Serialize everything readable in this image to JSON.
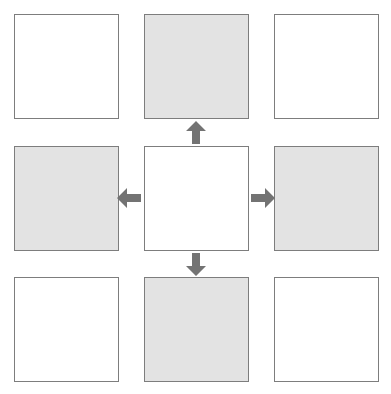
{
  "diagram": {
    "canvas": {
      "width": 391,
      "height": 394,
      "background": "#ffffff"
    },
    "style": {
      "cell_border_color": "#7d7d7d",
      "cell_border_width": 1.6,
      "white_fill": "#ffffff",
      "gray_fill": "#e3e3e3",
      "arrow_fill": "#737373"
    },
    "grid": {
      "rows": 3,
      "columns": 3,
      "cells": [
        {
          "id": "cell-top-left",
          "row": 0,
          "col": 0,
          "fill": "white",
          "x": 14,
          "y": 14,
          "width": 105,
          "height": 105,
          "label": ""
        },
        {
          "id": "cell-top-center",
          "row": 0,
          "col": 1,
          "fill": "gray",
          "x": 144,
          "y": 14,
          "width": 105,
          "height": 105,
          "label": ""
        },
        {
          "id": "cell-top-right",
          "row": 0,
          "col": 2,
          "fill": "white",
          "x": 274,
          "y": 14,
          "width": 105,
          "height": 105,
          "label": ""
        },
        {
          "id": "cell-middle-left",
          "row": 1,
          "col": 0,
          "fill": "gray",
          "x": 14,
          "y": 146,
          "width": 105,
          "height": 105,
          "label": ""
        },
        {
          "id": "cell-center",
          "row": 1,
          "col": 1,
          "fill": "white",
          "x": 144,
          "y": 146,
          "width": 105,
          "height": 105,
          "label": ""
        },
        {
          "id": "cell-middle-right",
          "row": 1,
          "col": 2,
          "fill": "gray",
          "x": 274,
          "y": 146,
          "width": 105,
          "height": 105,
          "label": ""
        },
        {
          "id": "cell-bottom-left",
          "row": 2,
          "col": 0,
          "fill": "white",
          "x": 14,
          "y": 277,
          "width": 105,
          "height": 105,
          "label": ""
        },
        {
          "id": "cell-bottom-center",
          "row": 2,
          "col": 1,
          "fill": "gray",
          "x": 144,
          "y": 277,
          "width": 105,
          "height": 105,
          "label": ""
        },
        {
          "id": "cell-bottom-right",
          "row": 2,
          "col": 2,
          "fill": "white",
          "x": 274,
          "y": 277,
          "width": 105,
          "height": 105,
          "label": ""
        }
      ]
    },
    "arrows": [
      {
        "id": "arrow-up",
        "direction": "up",
        "from": "cell-center",
        "to": "cell-top-center",
        "x": 186,
        "y": 121,
        "width": 20,
        "height": 23
      },
      {
        "id": "arrow-down",
        "direction": "down",
        "from": "cell-center",
        "to": "cell-bottom-center",
        "x": 186,
        "y": 253,
        "width": 20,
        "height": 23
      },
      {
        "id": "arrow-left",
        "direction": "left",
        "from": "cell-center",
        "to": "cell-middle-left",
        "x": 117,
        "y": 188,
        "width": 24,
        "height": 20
      },
      {
        "id": "arrow-right",
        "direction": "right",
        "from": "cell-center",
        "to": "cell-middle-right",
        "x": 251,
        "y": 188,
        "width": 24,
        "height": 20
      }
    ]
  }
}
